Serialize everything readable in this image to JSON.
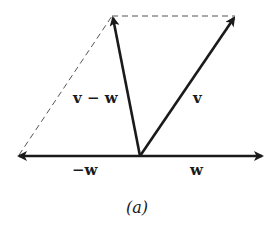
{
  "diagram": {
    "caption": "(a)",
    "labels": {
      "v_minus_w": "v − w",
      "v": "v",
      "neg_w": "−w",
      "w": "w"
    },
    "vectors": [
      {
        "name": "w",
        "from": [
          140,
          156
        ],
        "to": [
          263,
          156
        ],
        "style": "solid"
      },
      {
        "name": "-w",
        "from": [
          140,
          156
        ],
        "to": [
          18,
          156
        ],
        "style": "solid"
      },
      {
        "name": "v",
        "from": [
          140,
          156
        ],
        "to": [
          235,
          16
        ],
        "style": "solid"
      },
      {
        "name": "v-w",
        "from": [
          140,
          156
        ],
        "to": [
          112,
          16
        ],
        "style": "solid"
      }
    ],
    "dashed_lines": [
      {
        "from": [
          112,
          16
        ],
        "to": [
          235,
          16
        ]
      },
      {
        "from": [
          18,
          156
        ],
        "to": [
          112,
          16
        ]
      }
    ]
  }
}
